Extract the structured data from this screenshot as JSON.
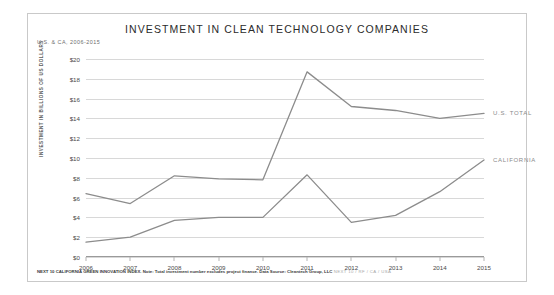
{
  "figure": {
    "title": "INVESTMENT IN CLEAN TECHNOLOGY COMPANIES",
    "subtitle": "U.S. & CA, 2006-2015",
    "ylabel": "INVESTMENT IN BILLIONS OF US DOLLARS",
    "footnote_main": "NEXT 10 CALIFORNIA GREEN INNOVATION INDEX. Note: Total investment number excludes project finance. Data Source: Cleantech Group, LLC",
    "footnote_tag": "NEXT 10 / RF / CA / USA"
  },
  "chart_data": {
    "type": "line",
    "title": "INVESTMENT IN CLEAN TECHNOLOGY COMPANIES",
    "subtitle": "U.S. & CA, 2006-2015",
    "xlabel": "",
    "ylabel": "INVESTMENT IN BILLIONS OF US DOLLARS",
    "categories": [
      "2006",
      "2007",
      "2008",
      "2009",
      "2010",
      "2011",
      "2012",
      "2013",
      "2014",
      "2015"
    ],
    "x": [
      2006,
      2007,
      2008,
      2009,
      2010,
      2011,
      2012,
      2013,
      2014,
      2015
    ],
    "ylim": [
      0,
      20
    ],
    "yticks": [
      0,
      2,
      4,
      6,
      8,
      10,
      12,
      14,
      16,
      18,
      20
    ],
    "ytick_labels": [
      "$0",
      "$2",
      "$4",
      "$6",
      "$8",
      "$10",
      "$12",
      "$14",
      "$16",
      "$18",
      "$20"
    ],
    "grid": "horizontal",
    "legend_position": "right-inline",
    "series": [
      {
        "name": "U.S. TOTAL",
        "color": "#8c8c8c",
        "values": [
          6.4,
          5.4,
          8.2,
          7.9,
          7.8,
          18.7,
          15.2,
          14.8,
          14.0,
          14.5
        ]
      },
      {
        "name": "CALIFORNIA",
        "color": "#8c8c8c",
        "values": [
          1.5,
          2.0,
          3.7,
          4.0,
          4.0,
          8.3,
          3.5,
          4.2,
          6.6,
          9.8
        ]
      }
    ]
  }
}
